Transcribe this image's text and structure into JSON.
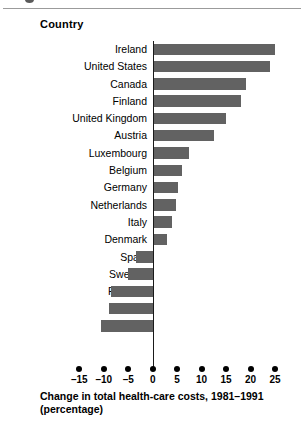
{
  "header": {
    "column_title": "Country"
  },
  "axis_title": {
    "line1": "Change in total health-care costs, 1981–1991",
    "line2": "(percentage)"
  },
  "chart_data": {
    "type": "bar",
    "orientation": "horizontal",
    "title": "",
    "xlabel": "Change in total health-care costs, 1981–1991 (percentage)",
    "ylabel": "Country",
    "xlim": [
      -17.5,
      27.5
    ],
    "xticks": [
      -15,
      -10,
      -5,
      0,
      5,
      10,
      15,
      20,
      25
    ],
    "xticklabels": [
      "–15",
      "–10",
      "–5",
      "0",
      "5",
      "10",
      "15",
      "20",
      "25"
    ],
    "grid": false,
    "legend": null,
    "bar_color": "#626262",
    "axis_color": "#000000",
    "categories": [
      "Ireland",
      "United States",
      "Canada",
      "Finland",
      "United Kingdom",
      "Austria",
      "Luxembourg",
      "Belgium",
      "Germany",
      "Netherlands",
      "Italy",
      "Denmark",
      "Spain",
      "Sweden",
      "Portugal",
      "Greece",
      "France"
    ],
    "values": [
      25,
      24,
      19,
      18,
      15,
      12.5,
      7.5,
      6,
      5.2,
      4.8,
      4,
      3,
      -3.5,
      -5,
      -8.5,
      -9,
      -10.5
    ]
  }
}
